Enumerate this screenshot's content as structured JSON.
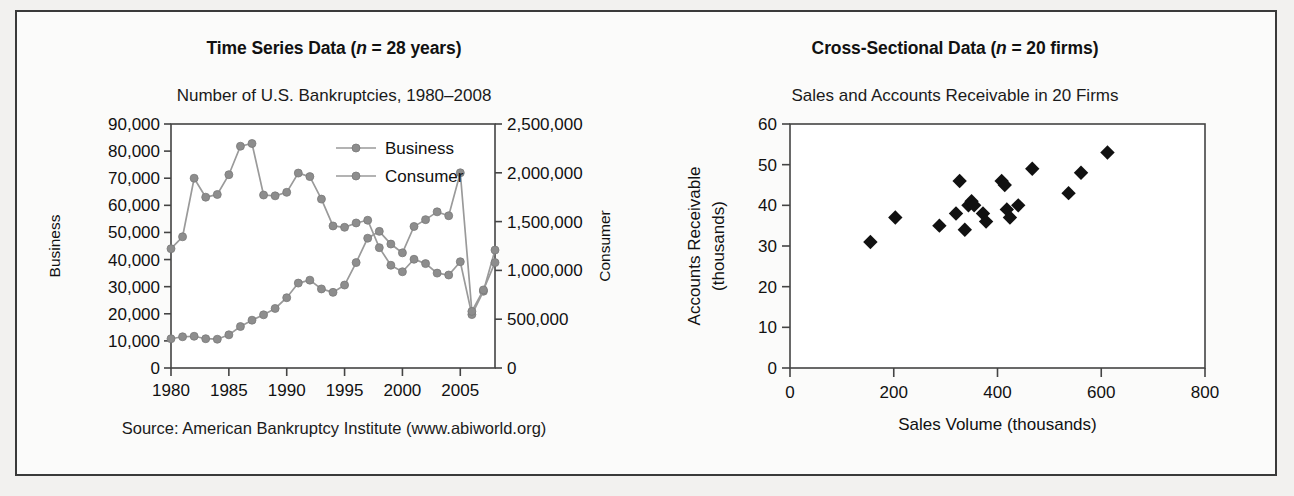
{
  "figure": {
    "background_color": "#f2f1ef",
    "frame_color": "#3a3a3a"
  },
  "left_panel": {
    "bold_title_prefix": "Time Series Data (",
    "bold_title_italic": "n",
    "bold_title_suffix": " = 28 years)",
    "subtitle": "Number of U.S. Bankruptcies, 1980–2008",
    "source": "Source: American Bankruptcy Institute (www.abiworld.org)"
  },
  "right_panel": {
    "bold_title_prefix": "Cross-Sectional Data (",
    "bold_title_italic": "n",
    "bold_title_suffix": " = 20 firms)",
    "subtitle": "Sales and Accounts Receivable in 20 Firms"
  },
  "chart_data": [
    {
      "type": "line",
      "title": "Number of U.S. Bankruptcies, 1980–2008",
      "xlabel": "",
      "ylabel": "Business",
      "y2label": "Consumer",
      "grid": false,
      "legend_position": "top-center-inside",
      "xlim": [
        1980,
        2008
      ],
      "xticks": [
        1980,
        1985,
        1990,
        1995,
        2000,
        2005
      ],
      "xticklabels": [
        "1980",
        "1985",
        "1990",
        "1995",
        "2000",
        "2005"
      ],
      "ylim": [
        0,
        90000
      ],
      "yticks": [
        0,
        10000,
        20000,
        30000,
        40000,
        50000,
        60000,
        70000,
        80000,
        90000
      ],
      "yticklabels": [
        "0",
        "10,000",
        "20,000",
        "30,000",
        "40,000",
        "50,000",
        "60,000",
        "70,000",
        "80,000",
        "90,000"
      ],
      "y2lim": [
        0,
        2500000
      ],
      "y2ticks": [
        0,
        500000,
        1000000,
        1500000,
        2000000,
        2500000
      ],
      "y2ticklabels": [
        "0",
        "500,000",
        "1,000,000",
        "1,500,000",
        "2,000,000",
        "2,500,000"
      ],
      "x": [
        1980,
        1981,
        1982,
        1983,
        1984,
        1985,
        1986,
        1987,
        1988,
        1989,
        1990,
        1991,
        1992,
        1993,
        1994,
        1995,
        1996,
        1997,
        1998,
        1999,
        2000,
        2001,
        2002,
        2003,
        2004,
        2005,
        2006,
        2007,
        2008
      ],
      "series": [
        {
          "name": "Business",
          "axis": "left",
          "color": "#8d8d8d",
          "values": [
            44000,
            48400,
            70000,
            63000,
            64000,
            71300,
            81800,
            82800,
            63800,
            63500,
            64800,
            71900,
            70600,
            62300,
            52400,
            51900,
            53500,
            54500,
            44400,
            37900,
            35500,
            40100,
            38500,
            35000,
            34300,
            39200,
            19700,
            28300,
            43500
          ]
        },
        {
          "name": "Consumer",
          "axis": "right",
          "color": "#8d8d8d",
          "values": [
            300000,
            320000,
            325000,
            300000,
            295000,
            340000,
            425000,
            490000,
            545000,
            610000,
            720000,
            870000,
            900000,
            810000,
            775000,
            850000,
            1080000,
            1330000,
            1400000,
            1270000,
            1180000,
            1450000,
            1520000,
            1600000,
            1560000,
            2000000,
            580000,
            800000,
            1080000
          ]
        }
      ]
    },
    {
      "type": "scatter",
      "title": "Sales and Accounts Receivable in 20 Firms",
      "xlabel": "Sales Volume (thousands)",
      "ylabel": "Accounts Receivable\n(thousands)",
      "ylabel_line1": "Accounts Receivable",
      "ylabel_line2": "(thousands)",
      "grid": false,
      "marker": "diamond",
      "marker_color": "#111111",
      "xlim": [
        0,
        800
      ],
      "xticks": [
        0,
        200,
        400,
        600,
        800
      ],
      "xticklabels": [
        "0",
        "200",
        "400",
        "600",
        "800"
      ],
      "ylim": [
        0,
        60
      ],
      "yticks": [
        0,
        10,
        20,
        30,
        40,
        50,
        60
      ],
      "yticklabels": [
        "0",
        "10",
        "20",
        "30",
        "40",
        "50",
        "60"
      ],
      "points": [
        {
          "x": 155,
          "y": 31
        },
        {
          "x": 203,
          "y": 37
        },
        {
          "x": 288,
          "y": 35
        },
        {
          "x": 320,
          "y": 38
        },
        {
          "x": 327,
          "y": 46
        },
        {
          "x": 337,
          "y": 34
        },
        {
          "x": 344,
          "y": 40
        },
        {
          "x": 350,
          "y": 41
        },
        {
          "x": 355,
          "y": 40
        },
        {
          "x": 372,
          "y": 38
        },
        {
          "x": 378,
          "y": 36
        },
        {
          "x": 408,
          "y": 46
        },
        {
          "x": 414,
          "y": 45
        },
        {
          "x": 418,
          "y": 39
        },
        {
          "x": 424,
          "y": 37
        },
        {
          "x": 440,
          "y": 40
        },
        {
          "x": 467,
          "y": 49
        },
        {
          "x": 537,
          "y": 43
        },
        {
          "x": 561,
          "y": 48
        },
        {
          "x": 612,
          "y": 53
        }
      ]
    }
  ]
}
